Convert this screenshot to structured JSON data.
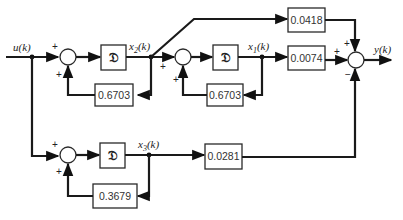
{
  "diagram": {
    "type": "block-diagram",
    "title": "",
    "input": {
      "label": "u(k)"
    },
    "output": {
      "label": "y(k)"
    },
    "states": [
      {
        "id": "x1",
        "label": "x1(k)",
        "label_main": "x",
        "label_sub": "1",
        "label_arg": "(k)"
      },
      {
        "id": "x2",
        "label": "x2(k)",
        "label_main": "x",
        "label_sub": "2",
        "label_arg": "(k)"
      },
      {
        "id": "x3",
        "label": "x3(k)",
        "label_main": "x",
        "label_sub": "3",
        "label_arg": "(k)"
      }
    ],
    "delay_symbol": "𝔇",
    "blocks": {
      "delay1": {
        "label": "𝔇"
      },
      "delay2": {
        "label": "𝔇"
      },
      "delay3": {
        "label": "𝔇"
      },
      "fb1": {
        "label": "0.6703"
      },
      "fb2": {
        "label": "0.6703"
      },
      "fb3": {
        "label": "0.3679"
      },
      "gain_x2": {
        "label": "0.0418"
      },
      "gain_x1": {
        "label": "0.0074"
      },
      "gain_x3": {
        "label": "0.0281"
      }
    },
    "sums": {
      "sum1": {
        "signs": [
          "+",
          "+"
        ]
      },
      "sum2": {
        "signs": [
          "+",
          "+"
        ]
      },
      "sum3": {
        "signs": [
          "+",
          "+",
          "−"
        ]
      },
      "sum4": {
        "signs": [
          "+",
          "+"
        ]
      }
    },
    "connections": [
      "u(k) → sum1 (+)",
      "0.6703·x2 → sum1 (+)",
      "sum1 → 𝔇 → x2(k)",
      "x2(k) → sum2 (+)",
      "0.6703·x1 → sum2 (+)",
      "sum2 → 𝔇 → x1(k)",
      "x2(k) → 0.0418 → sum3 (+)",
      "x1(k) → 0.0074 → sum3 (+)",
      "u(k) → sum4 (+)",
      "0.3679·x3 → sum4 (+)",
      "sum4 → 𝔇 → x3(k)",
      "x3(k) → 0.0281 → sum3 (−)",
      "sum3 → y(k)"
    ]
  }
}
